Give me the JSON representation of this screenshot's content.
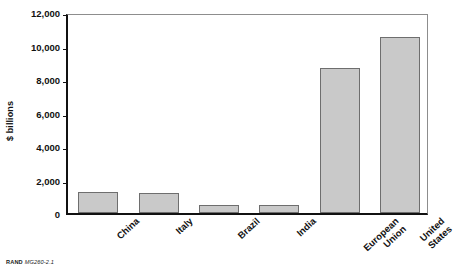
{
  "chart_data": {
    "type": "bar",
    "title": "",
    "subtitle": "",
    "xlabel": "",
    "ylabel": "$ billions",
    "categories": [
      "China",
      "Italy",
      "Brazil",
      "India",
      "European Union",
      "United States"
    ],
    "category_lines": [
      [
        "China"
      ],
      [
        "Italy"
      ],
      [
        "Brazil"
      ],
      [
        "India"
      ],
      [
        "European",
        "Union"
      ],
      [
        "United",
        "States"
      ]
    ],
    "values": [
      1250,
      1200,
      450,
      500,
      8650,
      10500
    ],
    "ylim": [
      0,
      12000
    ],
    "yticks": [
      0,
      2000,
      4000,
      6000,
      8000,
      10000,
      12000
    ],
    "ytick_labels": [
      "0",
      "2,000",
      "4,000",
      "6,000",
      "8,000",
      "10,000",
      "12,000"
    ],
    "grid": false,
    "legend": null,
    "legend_position": "none",
    "bar_fill": "#c9c9c9",
    "bar_border": "#6e6e6e",
    "axis_color": "#111111",
    "frame_color": "#8d8d8d"
  },
  "footer": {
    "brand": "RAND",
    "figure_number": "MG260-2.1"
  }
}
